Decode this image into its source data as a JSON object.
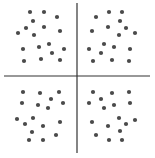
{
  "diagram": {
    "background": "#ffffff",
    "line_color": "#333333",
    "dot_color": "#4a4a4a",
    "dot_radius": 2.1,
    "axes": {
      "vertical": {
        "x": 77,
        "y1": 3,
        "y2": 153
      },
      "horizontal": {
        "y": 76,
        "x1": 4,
        "x2": 150
      }
    },
    "quadrants": [
      {
        "name": "top-left",
        "points": [
          [
            30,
            12
          ],
          [
            44,
            12
          ],
          [
            57,
            17
          ],
          [
            33,
            21
          ],
          [
            26,
            28
          ],
          [
            44,
            27
          ],
          [
            18,
            33
          ],
          [
            60,
            31
          ],
          [
            34,
            35
          ],
          [
            23,
            49
          ],
          [
            39,
            47
          ],
          [
            49,
            44
          ],
          [
            64,
            49
          ],
          [
            52,
            53
          ],
          [
            24,
            61
          ],
          [
            41,
            59
          ],
          [
            60,
            60
          ]
        ]
      },
      {
        "name": "top-right",
        "points": [
          [
            109,
            12
          ],
          [
            122,
            12
          ],
          [
            96,
            17
          ],
          [
            120,
            21
          ],
          [
            108,
            27
          ],
          [
            126,
            28
          ],
          [
            92,
            31
          ],
          [
            135,
            33
          ],
          [
            119,
            35
          ],
          [
            104,
            44
          ],
          [
            114,
            47
          ],
          [
            89,
            49
          ],
          [
            130,
            49
          ],
          [
            101,
            53
          ],
          [
            93,
            61
          ],
          [
            112,
            60
          ],
          [
            129,
            61
          ]
        ]
      },
      {
        "name": "bottom-left",
        "points": [
          [
            23,
            92
          ],
          [
            40,
            93
          ],
          [
            59,
            92
          ],
          [
            51,
            99
          ],
          [
            22,
            103
          ],
          [
            38,
            105
          ],
          [
            63,
            103
          ],
          [
            48,
            108
          ],
          [
            17,
            119
          ],
          [
            33,
            118
          ],
          [
            25,
            124
          ],
          [
            60,
            122
          ],
          [
            43,
            126
          ],
          [
            32,
            132
          ],
          [
            56,
            135
          ],
          [
            29,
            140
          ],
          [
            43,
            140
          ]
        ]
      },
      {
        "name": "bottom-right",
        "points": [
          [
            93,
            92
          ],
          [
            112,
            93
          ],
          [
            129,
            92
          ],
          [
            101,
            99
          ],
          [
            89,
            103
          ],
          [
            114,
            105
          ],
          [
            130,
            103
          ],
          [
            104,
            108
          ],
          [
            119,
            118
          ],
          [
            135,
            120
          ],
          [
            92,
            122
          ],
          [
            126,
            124
          ],
          [
            108,
            126
          ],
          [
            120,
            131
          ],
          [
            96,
            135
          ],
          [
            109,
            140
          ],
          [
            122,
            140
          ]
        ]
      }
    ]
  }
}
